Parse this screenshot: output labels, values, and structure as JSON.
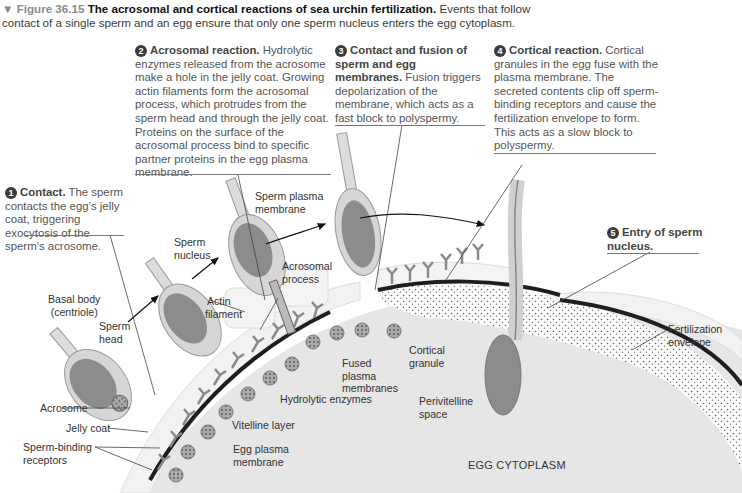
{
  "caption": {
    "marker": "▼",
    "figure_label": "Figure 36.15",
    "title": "The acrosomal and cortical reactions of sea urchin fertilization.",
    "text": "Events that follow contact of a single sperm and an egg ensure that only one sperm nucleus enters the egg cytoplasm."
  },
  "steps": [
    {
      "num": "1",
      "heading": "Contact.",
      "body": "The sperm contacts the egg’s jelly coat, triggering exocytosis of the sperm’s acrosome."
    },
    {
      "num": "2",
      "heading": "Acrosomal reaction.",
      "body": "Hydrolytic enzymes released from the acrosome make a hole in the jelly coat. Growing actin filaments form the acrosomal process, which protrudes from the sperm head and through the jelly coat. Proteins on the surface of the acrosomal process bind to specific partner proteins in the egg plasma membrane."
    },
    {
      "num": "3",
      "heading": "Contact and fusion of sperm and egg membranes.",
      "body": "Fusion triggers depolarization of the membrane, which acts as a fast block to polyspermy."
    },
    {
      "num": "4",
      "heading": "Cortical reaction.",
      "body": "Cortical granules in the egg fuse with the plasma membrane. The secreted contents clip off sperm-binding receptors and cause the fertilization envelope to form. This acts as a slow block to polyspermy."
    },
    {
      "num": "5",
      "heading": "Entry of sperm nucleus.",
      "body": ""
    }
  ],
  "labels": {
    "basal_body": "Basal body",
    "centriole": "(centriole)",
    "sperm_head_1": "Sperm",
    "sperm_head_2": "head",
    "acrosome": "Acrosome",
    "jelly_coat": "Jelly coat",
    "receptors_1": "Sperm-binding",
    "receptors_2": "receptors",
    "sperm_nucleus_1": "Sperm",
    "sperm_nucleus_2": "nucleus",
    "actin_1": "Actin",
    "actin_2": "filament",
    "acrosomal_process_1": "Acrosomal",
    "acrosomal_process_2": "process",
    "sperm_plasma_1": "Sperm plasma",
    "sperm_plasma_2": "membrane",
    "hydrolytic": "Hydrolytic enzymes",
    "vitelline": "Vitelline layer",
    "egg_plasma_1": "Egg plasma",
    "egg_plasma_2": "membrane",
    "fused_1": "Fused",
    "fused_2": "plasma",
    "fused_3": "membranes",
    "cortical_1": "Cortical",
    "cortical_2": "granule",
    "perivitelline_1": "Perivitelline",
    "perivitelline_2": "space",
    "fert_env_1": "Fertilization",
    "fert_env_2": "envelope",
    "egg_cytoplasm": "EGG CYTOPLASM"
  },
  "colors": {
    "egg_cytoplasm": "#e6e6e6",
    "jelly_coat": "#f1f1f1",
    "membrane": "#1e1e1e",
    "sperm_body": "#d6d6d6",
    "sperm_nucleus": "#8c8c8c",
    "receptor": "#9a9a9a",
    "step_badge": "#3c3c3c"
  }
}
